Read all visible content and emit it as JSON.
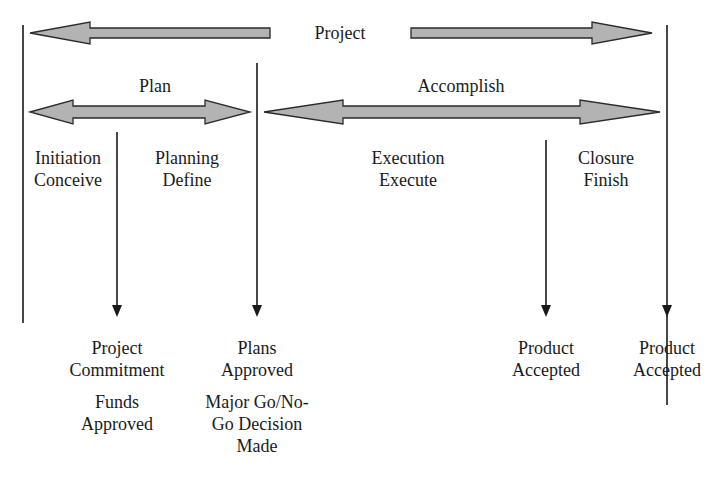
{
  "diagram": {
    "type": "project-lifecycle",
    "colors": {
      "arrow_fill": "#b3b3b3",
      "arrow_stroke": "#2a2a2a",
      "line": "#1a1a1a"
    },
    "top_label": "Project",
    "groups": {
      "plan": "Plan",
      "accomplish": "Accomplish"
    },
    "phases": [
      {
        "name": "Initiation",
        "verb": "Conceive"
      },
      {
        "name": "Planning",
        "verb": "Define"
      },
      {
        "name": "Execution",
        "verb": "Execute"
      },
      {
        "name": "Closure",
        "verb": "Finish"
      }
    ],
    "milestones": [
      {
        "line1": "Project",
        "line2": "Commitment",
        "extra1": "Funds",
        "extra2": "Approved",
        "extra3": ""
      },
      {
        "line1": "Plans",
        "line2": "Approved",
        "extra1": "Major Go/No-",
        "extra2": "Go Decision",
        "extra3": "Made"
      },
      {
        "line1": "Product",
        "line2": "Accepted"
      },
      {
        "line1": "Product",
        "line2": "Accepted"
      }
    ]
  }
}
